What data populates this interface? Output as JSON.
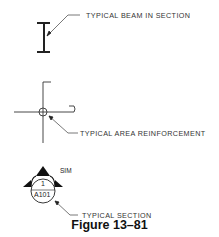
{
  "figure": {
    "caption": "Figure 13–81"
  },
  "symbols": [
    {
      "id": "beam",
      "icon": "i-beam-section-icon",
      "label": "TYPICAL BEAM IN SECTION"
    },
    {
      "id": "area",
      "icon": "area-reinforcement-icon",
      "label": "TYPICAL AREA REINFORCEMENT"
    },
    {
      "id": "section",
      "icon": "section-marker-icon",
      "label": "TYPICAL SECTION",
      "number": "1",
      "sheet": "A101",
      "note": "SIM"
    }
  ],
  "colors": {
    "line": "#222222",
    "leader": "#444444"
  }
}
